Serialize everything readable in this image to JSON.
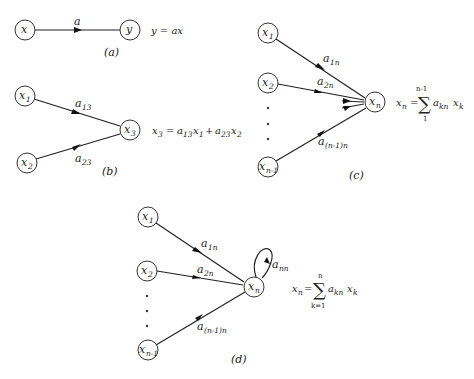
{
  "figure": {
    "panels": [
      {
        "id": "a",
        "caption": "(a)",
        "nodes": [
          {
            "id": "x",
            "label": "x",
            "sub": ""
          },
          {
            "id": "y",
            "label": "y",
            "sub": ""
          }
        ],
        "edges": [
          {
            "from": "x",
            "to": "y",
            "label": "a",
            "sub": ""
          }
        ],
        "equation": "y = ax"
      },
      {
        "id": "b",
        "caption": "(b)",
        "nodes": [
          {
            "id": "x1",
            "label": "x",
            "sub": "1"
          },
          {
            "id": "x2",
            "label": "x",
            "sub": "2"
          },
          {
            "id": "x3",
            "label": "x",
            "sub": "3"
          }
        ],
        "edges": [
          {
            "from": "x1",
            "to": "x3",
            "label": "a",
            "sub": "13"
          },
          {
            "from": "x2",
            "to": "x3",
            "label": "a",
            "sub": "23"
          }
        ],
        "equation": {
          "lhs": "x",
          "lhs_sub": "3",
          "rhs": [
            {
              "t": "a",
              "s": "13"
            },
            {
              "t": "x",
              "s": "1"
            },
            {
              "op": "+"
            },
            {
              "t": "a",
              "s": "23"
            },
            {
              "t": "x",
              "s": "2"
            }
          ]
        }
      },
      {
        "id": "c",
        "caption": "(c)",
        "nodes": [
          {
            "id": "x1",
            "label": "x",
            "sub": "1"
          },
          {
            "id": "x2",
            "label": "x",
            "sub": "2"
          },
          {
            "id": "xn1",
            "label": "x",
            "sub": "n-1"
          },
          {
            "id": "xn",
            "label": "x",
            "sub": "n"
          }
        ],
        "edges": [
          {
            "from": "x1",
            "to": "xn",
            "label": "a",
            "sub": "1n"
          },
          {
            "from": "x2",
            "to": "xn",
            "label": "a",
            "sub": "2n"
          },
          {
            "from": "xn1",
            "to": "xn",
            "label": "a",
            "sub": "(n-1)n"
          }
        ],
        "ellipsis": "⋮",
        "equation": {
          "lhs": "x",
          "lhs_sub": "n",
          "sum_upper": "n-1",
          "sum_lower": "1",
          "term": "a",
          "term_sub": "kn",
          "var": "x",
          "var_sub": "k"
        }
      },
      {
        "id": "d",
        "caption": "(d)",
        "nodes": [
          {
            "id": "x1",
            "label": "x",
            "sub": "1"
          },
          {
            "id": "x2",
            "label": "x",
            "sub": "2"
          },
          {
            "id": "xn1",
            "label": "x",
            "sub": "n-1"
          },
          {
            "id": "xn",
            "label": "x",
            "sub": "n"
          }
        ],
        "edges": [
          {
            "from": "x1",
            "to": "xn",
            "label": "a",
            "sub": "1n"
          },
          {
            "from": "x2",
            "to": "xn",
            "label": "a",
            "sub": "2n"
          },
          {
            "from": "xn1",
            "to": "xn",
            "label": "a",
            "sub": "(n-1)n"
          },
          {
            "from": "xn",
            "to": "xn",
            "label": "a",
            "sub": "nn",
            "self_loop": true
          }
        ],
        "equation": {
          "lhs": "x",
          "lhs_sub": "n",
          "sum_upper": "n",
          "sum_lower": "k=1",
          "term": "a",
          "term_sub": "kn",
          "var": "x",
          "var_sub": "k"
        }
      }
    ]
  },
  "text": {
    "eq_a": "y = ax",
    "equals": "=",
    "plus": "+",
    "sigma": "∑"
  }
}
